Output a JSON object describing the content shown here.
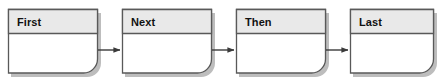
{
  "diagram": {
    "type": "flowchart",
    "orientation": "left-to-right",
    "canvas": {
      "width": 442,
      "height": 81,
      "background": "#ffffff"
    },
    "style": {
      "node_header_fill": "#e9e9e9",
      "node_body_fill": "#ffffff",
      "node_border": "#595959",
      "node_divider": "#595959",
      "node_shadow": "#bdbdbd",
      "connector_color": "#3a3a3a",
      "label_color": "#111111",
      "corner_radius_bottom_right": 14
    },
    "nodes": [
      {
        "id": "node-first",
        "label": "First",
        "x": 8,
        "y": 9,
        "width": 90,
        "height": 64,
        "header_height": 24
      },
      {
        "id": "node-next",
        "label": "Next",
        "x": 122,
        "y": 9,
        "width": 90,
        "height": 64,
        "header_height": 24
      },
      {
        "id": "node-then",
        "label": "Then",
        "x": 236,
        "y": 9,
        "width": 90,
        "height": 64,
        "header_height": 24
      },
      {
        "id": "node-last",
        "label": "Last",
        "x": 350,
        "y": 9,
        "width": 84,
        "height": 64,
        "header_height": 24
      }
    ],
    "connectors": [
      {
        "id": "connector-first-next",
        "from": "node-first",
        "to": "node-next",
        "x1": 98,
        "x2": 122,
        "y": 50,
        "arrowhead": "solid-triangle"
      },
      {
        "id": "connector-next-then",
        "from": "node-next",
        "to": "node-then",
        "x1": 212,
        "x2": 236,
        "y": 50,
        "arrowhead": "solid-triangle"
      },
      {
        "id": "connector-then-last",
        "from": "node-then",
        "to": "node-last",
        "x1": 326,
        "x2": 350,
        "y": 50,
        "arrowhead": "solid-triangle"
      }
    ]
  }
}
